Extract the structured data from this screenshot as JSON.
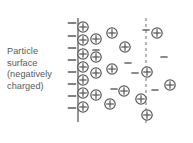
{
  "figure": {
    "background_color": "#ffffff",
    "ink_color": "#58595b",
    "width": 193,
    "height": 143
  },
  "caption": {
    "lines": [
      "Particle",
      "surface",
      "(negatively",
      "charged)"
    ],
    "full_text": "Particle surface (negatively charged)",
    "color": "#58595b",
    "font_size_px": 9.2
  },
  "chart_data": {
    "type": "diagram",
    "title": "Particle surface (negatively charged)",
    "surface_line": {
      "style": "solid",
      "x": 78,
      "y_top": 18,
      "y_bottom": 122,
      "stroke_width": 1.6,
      "color": "#7a7c7f"
    },
    "shear_plane_line": {
      "style": "dashed",
      "x": 146,
      "y_top": 18,
      "y_bottom": 126,
      "stroke_width": 1.1,
      "dash_pattern": "3,3",
      "color": "#7a7c7f"
    },
    "surface_negative_charges": {
      "symbol": "minus",
      "count": 8,
      "x": 72,
      "half_length": 4.2,
      "y_values": [
        23,
        36,
        48,
        60,
        72,
        84,
        96,
        108
      ]
    },
    "positive_ions": {
      "symbol": "circled-plus",
      "radius": 5.2,
      "count": 21,
      "points": [
        {
          "x": 83,
          "y": 27
        },
        {
          "x": 83,
          "y": 40
        },
        {
          "x": 83,
          "y": 54
        },
        {
          "x": 83,
          "y": 67
        },
        {
          "x": 83,
          "y": 80
        },
        {
          "x": 83,
          "y": 93
        },
        {
          "x": 83,
          "y": 107
        },
        {
          "x": 96,
          "y": 39
        },
        {
          "x": 96,
          "y": 57
        },
        {
          "x": 96,
          "y": 73
        },
        {
          "x": 96,
          "y": 95
        },
        {
          "x": 112,
          "y": 33
        },
        {
          "x": 112,
          "y": 69
        },
        {
          "x": 110,
          "y": 104
        },
        {
          "x": 125,
          "y": 47
        },
        {
          "x": 124,
          "y": 91
        },
        {
          "x": 141,
          "y": 99
        },
        {
          "x": 147,
          "y": 72
        },
        {
          "x": 157,
          "y": 33
        },
        {
          "x": 170,
          "y": 85
        },
        {
          "x": 147,
          "y": 115
        }
      ]
    },
    "negative_ions": {
      "symbol": "minus",
      "half_length": 3.6,
      "count": 6,
      "points": [
        {
          "x": 96,
          "y": 50
        },
        {
          "x": 128,
          "y": 63
        },
        {
          "x": 135,
          "y": 73
        },
        {
          "x": 114,
          "y": 89
        },
        {
          "x": 155,
          "y": 90
        },
        {
          "x": 164,
          "y": 57
        },
        {
          "x": 146,
          "y": 30
        }
      ]
    }
  }
}
